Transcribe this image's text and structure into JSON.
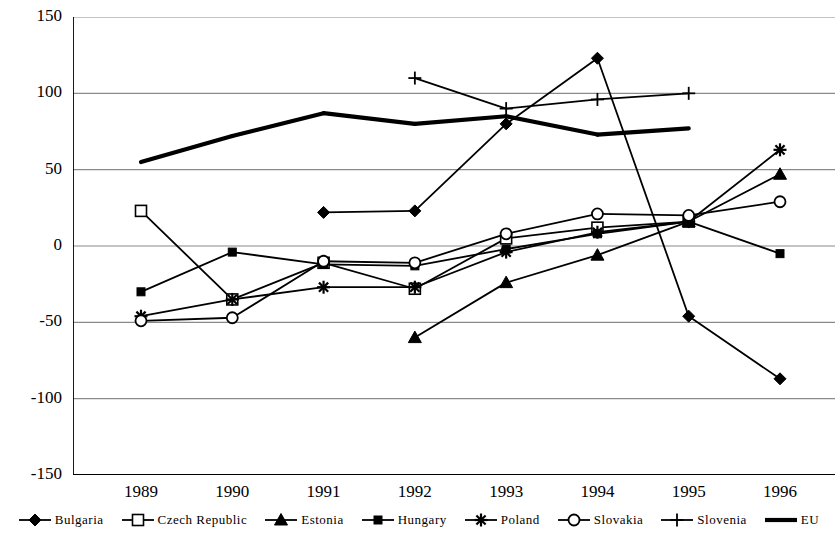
{
  "chart_data": {
    "type": "line",
    "title": "",
    "xlabel": "",
    "ylabel": "NPR in %",
    "categories": [
      "1989",
      "1990",
      "1991",
      "1992",
      "1993",
      "1994",
      "1995",
      "1996"
    ],
    "x": [
      1989,
      1990,
      1991,
      1992,
      1993,
      1994,
      1995,
      1996
    ],
    "ylim": [
      -150,
      150
    ],
    "yticks": [
      150,
      100,
      50,
      0,
      -50,
      -100,
      -150
    ],
    "ytick_labels": [
      "150",
      "100",
      "50",
      "0",
      "-50",
      "-100",
      "-150"
    ],
    "grid": true,
    "legend_position": "bottom",
    "series": [
      {
        "name": "Bulgaria",
        "marker": "filled-diamond",
        "values": [
          null,
          null,
          22,
          23,
          80,
          123,
          -46,
          -87
        ]
      },
      {
        "name": "Czech Republic",
        "marker": "open-square",
        "values": [
          23,
          -35,
          -11,
          -28,
          5,
          12,
          16,
          null
        ]
      },
      {
        "name": "Estonia",
        "marker": "filled-triangle",
        "values": [
          null,
          null,
          null,
          -60,
          -24,
          -6,
          16,
          47
        ]
      },
      {
        "name": "Hungary",
        "marker": "filled-square",
        "values": [
          -30,
          -4,
          -12,
          -13,
          -2,
          8,
          16,
          -5
        ]
      },
      {
        "name": "Poland",
        "marker": "asterisk",
        "values": [
          -46,
          -35,
          -27,
          -27,
          -4,
          9,
          16,
          63
        ]
      },
      {
        "name": "Slovakia",
        "marker": "open-circle",
        "values": [
          -49,
          -47,
          -10,
          -11,
          8,
          21,
          20,
          29
        ]
      },
      {
        "name": "Slovenia",
        "marker": "plus",
        "values": [
          null,
          null,
          null,
          110,
          90,
          96,
          100,
          null
        ]
      },
      {
        "name": "EU",
        "marker": "none",
        "values": [
          55,
          72,
          87,
          80,
          85,
          73,
          77,
          null
        ]
      }
    ]
  },
  "legend": {
    "items": [
      {
        "label": "Bulgaria",
        "marker": "filled-diamond"
      },
      {
        "label": "Czech Republic",
        "marker": "open-square"
      },
      {
        "label": "Estonia",
        "marker": "filled-triangle"
      },
      {
        "label": "Hungary",
        "marker": "filled-square"
      },
      {
        "label": "Poland",
        "marker": "asterisk"
      },
      {
        "label": "Slovakia",
        "marker": "open-circle"
      },
      {
        "label": "Slovenia",
        "marker": "plus"
      },
      {
        "label": "EU",
        "marker": "none"
      }
    ]
  },
  "colors": {
    "ink": "#000000",
    "grid": "#8a8a8a",
    "background": "#ffffff"
  }
}
